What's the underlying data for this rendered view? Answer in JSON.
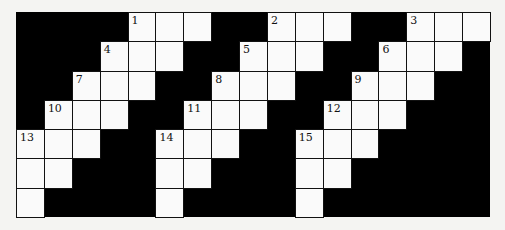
{
  "puzzle": {
    "type": "crossword-grid",
    "rows": 7,
    "cols": 17,
    "colors": {
      "block": "#000000",
      "cell": "#fafafa",
      "line": "#111111"
    },
    "white_cells": [
      {
        "r": 0,
        "c": 4,
        "n": "1"
      },
      {
        "r": 0,
        "c": 5
      },
      {
        "r": 0,
        "c": 6
      },
      {
        "r": 0,
        "c": 9,
        "n": "2"
      },
      {
        "r": 0,
        "c": 10
      },
      {
        "r": 0,
        "c": 11
      },
      {
        "r": 0,
        "c": 14,
        "n": "3"
      },
      {
        "r": 0,
        "c": 15
      },
      {
        "r": 0,
        "c": 16
      },
      {
        "r": 1,
        "c": 3,
        "n": "4"
      },
      {
        "r": 1,
        "c": 4
      },
      {
        "r": 1,
        "c": 5
      },
      {
        "r": 1,
        "c": 8,
        "n": "5"
      },
      {
        "r": 1,
        "c": 9
      },
      {
        "r": 1,
        "c": 10
      },
      {
        "r": 1,
        "c": 13,
        "n": "6"
      },
      {
        "r": 1,
        "c": 14
      },
      {
        "r": 1,
        "c": 15
      },
      {
        "r": 2,
        "c": 2,
        "n": "7"
      },
      {
        "r": 2,
        "c": 3
      },
      {
        "r": 2,
        "c": 4
      },
      {
        "r": 2,
        "c": 7,
        "n": "8"
      },
      {
        "r": 2,
        "c": 8
      },
      {
        "r": 2,
        "c": 9
      },
      {
        "r": 2,
        "c": 12,
        "n": "9"
      },
      {
        "r": 2,
        "c": 13
      },
      {
        "r": 2,
        "c": 14
      },
      {
        "r": 3,
        "c": 1,
        "n": "10"
      },
      {
        "r": 3,
        "c": 2
      },
      {
        "r": 3,
        "c": 3
      },
      {
        "r": 3,
        "c": 6,
        "n": "11"
      },
      {
        "r": 3,
        "c": 7
      },
      {
        "r": 3,
        "c": 8
      },
      {
        "r": 3,
        "c": 11,
        "n": "12"
      },
      {
        "r": 3,
        "c": 12
      },
      {
        "r": 3,
        "c": 13
      },
      {
        "r": 4,
        "c": 0,
        "n": "13"
      },
      {
        "r": 4,
        "c": 1
      },
      {
        "r": 4,
        "c": 2
      },
      {
        "r": 4,
        "c": 5,
        "n": "14"
      },
      {
        "r": 4,
        "c": 6
      },
      {
        "r": 4,
        "c": 7
      },
      {
        "r": 4,
        "c": 10,
        "n": "15"
      },
      {
        "r": 4,
        "c": 11
      },
      {
        "r": 4,
        "c": 12
      },
      {
        "r": 5,
        "c": 0
      },
      {
        "r": 5,
        "c": 1
      },
      {
        "r": 5,
        "c": 5
      },
      {
        "r": 5,
        "c": 6
      },
      {
        "r": 5,
        "c": 10
      },
      {
        "r": 5,
        "c": 11
      },
      {
        "r": 6,
        "c": 0
      },
      {
        "r": 6,
        "c": 5
      },
      {
        "r": 6,
        "c": 10
      }
    ]
  }
}
